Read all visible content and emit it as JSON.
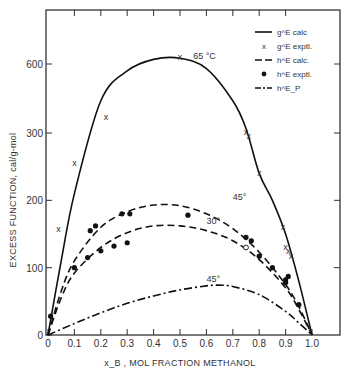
{
  "chart_data": {
    "type": "line",
    "title": "",
    "xlabel": "x_B , MOL FRACTION METHANOL",
    "ylabel": "EXCESS FUNCTION, cal/g-mol",
    "xlim": [
      0,
      1.1
    ],
    "ylim": [
      0,
      800
    ],
    "x_ticks": [
      "0",
      "0.1",
      "0.2",
      "0.3",
      "0.4",
      "0.5",
      "0.6",
      "0.7",
      "0.8",
      "0.9",
      "1.0"
    ],
    "y_ticks": [
      "0",
      "100",
      "200",
      "300",
      "600"
    ],
    "y_scale_note": "broken scale: linear 0-300, compressed 300-600",
    "grid": false,
    "legend_position": "upper right",
    "legend": [
      {
        "style": "solid",
        "label": "g^E calc"
      },
      {
        "style": "x-marker",
        "label": "g^E exptl."
      },
      {
        "style": "dashed",
        "label": "h^E calc."
      },
      {
        "style": "dot-marker",
        "label": "h^E exptl."
      },
      {
        "style": "dash-dot",
        "label": "h^E_P"
      }
    ],
    "annotations": [
      {
        "text": "65 °C",
        "x": 0.55,
        "y": 620
      },
      {
        "text": "45°",
        "x": 0.7,
        "y": 200
      },
      {
        "text": "30°",
        "x": 0.6,
        "y": 165
      },
      {
        "text": "45°",
        "x": 0.6,
        "y": 78
      }
    ],
    "series": [
      {
        "name": "g^E calc (65 °C)",
        "style": "solid",
        "x": [
          0,
          0.05,
          0.1,
          0.2,
          0.3,
          0.4,
          0.5,
          0.6,
          0.7,
          0.75,
          0.8,
          0.85,
          0.9,
          0.95,
          1.0
        ],
        "y": [
          0,
          110,
          210,
          440,
          570,
          620,
          625,
          580,
          440,
          320,
          240,
          200,
          150,
          80,
          0
        ]
      },
      {
        "name": "g^E exptl.",
        "style": "x",
        "x": [
          0.04,
          0.1,
          0.22,
          0.5,
          0.75,
          0.76,
          0.8,
          0.89,
          0.9,
          0.91,
          0.92
        ],
        "y": [
          158,
          255,
          370,
          630,
          305,
          295,
          240,
          160,
          130,
          125,
          118
        ]
      },
      {
        "name": "h^E calc. (45°)",
        "style": "dashed",
        "x": [
          0,
          0.05,
          0.1,
          0.2,
          0.3,
          0.4,
          0.5,
          0.6,
          0.7,
          0.8,
          0.9,
          0.95,
          1.0
        ],
        "y": [
          0,
          65,
          110,
          160,
          183,
          193,
          192,
          180,
          158,
          123,
          75,
          42,
          0
        ]
      },
      {
        "name": "h^E calc. (30°)",
        "style": "dashed",
        "x": [
          0,
          0.05,
          0.1,
          0.2,
          0.3,
          0.4,
          0.5,
          0.6,
          0.7,
          0.8,
          0.9,
          0.95,
          1.0
        ],
        "y": [
          0,
          55,
          92,
          130,
          152,
          162,
          162,
          155,
          140,
          112,
          70,
          38,
          0
        ]
      },
      {
        "name": "h^E exptl.",
        "style": "dot",
        "x": [
          0.01,
          0.1,
          0.15,
          0.16,
          0.18,
          0.2,
          0.25,
          0.28,
          0.3,
          0.31,
          0.53,
          0.75,
          0.77,
          0.8,
          0.85,
          0.9,
          0.9,
          0.91,
          0.95
        ],
        "y": [
          28,
          100,
          115,
          155,
          162,
          125,
          132,
          180,
          137,
          180,
          178,
          145,
          140,
          117,
          100,
          78,
          82,
          87,
          45
        ]
      },
      {
        "name": "h^E exptl. (open)",
        "style": "open-circle",
        "x": [
          0.75
        ],
        "y": [
          130
        ]
      },
      {
        "name": "h^E_P (45°)",
        "style": "dash-dot",
        "x": [
          0,
          0.1,
          0.2,
          0.3,
          0.4,
          0.5,
          0.6,
          0.65,
          0.7,
          0.8,
          0.9,
          0.95,
          1.0
        ],
        "y": [
          0,
          17,
          33,
          47,
          58,
          67,
          73,
          74,
          72,
          60,
          35,
          18,
          0
        ]
      }
    ]
  }
}
